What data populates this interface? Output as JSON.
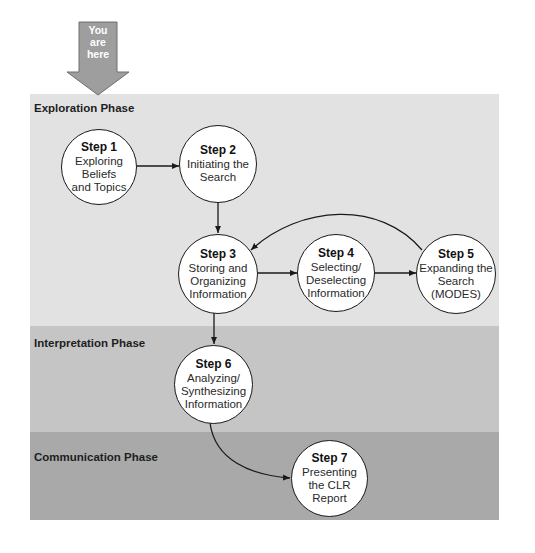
{
  "indicator": {
    "label_lines": [
      "You",
      "are",
      "here"
    ],
    "color": "#9e9e9e"
  },
  "phases": [
    {
      "label": "Exploration Phase",
      "color": "#e2e2e2"
    },
    {
      "label": "Interpretation Phase",
      "color": "#c5c5c5"
    },
    {
      "label": "Communication Phase",
      "color": "#a9a9a9"
    }
  ],
  "steps": [
    {
      "title": "Step 1",
      "lines": [
        "Exploring",
        "Beliefs",
        "and Topics"
      ]
    },
    {
      "title": "Step 2",
      "lines": [
        "Initiating the",
        "Search"
      ]
    },
    {
      "title": "Step 3",
      "lines": [
        "Storing and",
        "Organizing",
        "Information"
      ]
    },
    {
      "title": "Step 4",
      "lines": [
        "Selecting/",
        "Deselecting",
        "Information"
      ]
    },
    {
      "title": "Step 5",
      "lines": [
        "Expanding the",
        "Search",
        "(MODES)"
      ]
    },
    {
      "title": "Step 6",
      "lines": [
        "Analyzing/",
        "Synthesizing",
        "Information"
      ]
    },
    {
      "title": "Step 7",
      "lines": [
        "Presenting",
        "the CLR",
        "Report"
      ]
    }
  ],
  "connections": [
    {
      "from": "Step 1",
      "to": "Step 2",
      "type": "bidirectional"
    },
    {
      "from": "Step 2",
      "to": "Step 3",
      "type": "directed"
    },
    {
      "from": "Step 3",
      "to": "Step 4",
      "type": "bidirectional"
    },
    {
      "from": "Step 4",
      "to": "Step 5",
      "type": "bidirectional"
    },
    {
      "from": "Step 5",
      "to": "Step 3",
      "type": "directed-curved"
    },
    {
      "from": "Step 3",
      "to": "Step 6",
      "type": "directed"
    },
    {
      "from": "Step 6",
      "to": "Step 7",
      "type": "directed-curved"
    }
  ]
}
